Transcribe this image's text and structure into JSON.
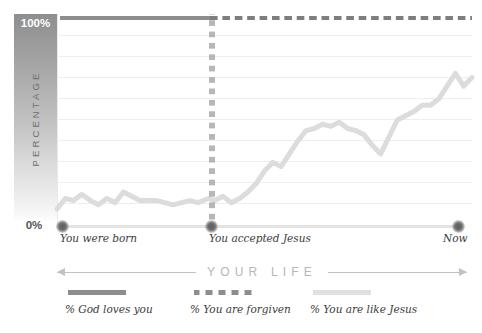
{
  "chart_data": {
    "type": "line",
    "title": "",
    "xlabel": "YOUR LIFE",
    "ylabel": "PERCENTAGE",
    "ylim": [
      0,
      100
    ],
    "y_ticks": [
      "0%",
      "100%"
    ],
    "grid": true,
    "gridline_count": 9,
    "x_markers": [
      {
        "label": "You were born",
        "x_pct": 0
      },
      {
        "label": "You accepted Jesus",
        "x_pct": 36.5
      },
      {
        "label": "Now",
        "x_pct": 100
      }
    ],
    "legend_position": "bottom",
    "series": [
      {
        "name": "% God loves you",
        "style": "solid",
        "color": "#8d8d8d",
        "constant_value": 100,
        "x": [
          0,
          36.5
        ],
        "values": [
          100,
          100
        ]
      },
      {
        "name": "% You are forgiven",
        "style": "dashed",
        "color": "#7e7e7e",
        "constant_value": 100,
        "x": [
          36.5,
          100
        ],
        "values": [
          100,
          100
        ]
      },
      {
        "name": "% You are like Jesus",
        "style": "solid",
        "color": "#dcdcdc",
        "x": [
          0,
          2,
          4,
          6,
          8,
          10,
          12,
          14,
          16,
          18,
          20,
          22,
          24,
          26,
          28,
          30,
          32,
          34,
          36.5,
          38,
          40,
          42,
          44,
          46,
          48,
          50,
          52,
          54,
          56,
          58,
          60,
          62,
          64,
          66,
          68,
          70,
          72,
          74,
          76,
          78,
          80,
          82,
          84,
          86,
          88,
          90,
          92,
          94,
          96,
          98,
          100
        ],
        "values": [
          8,
          13,
          12,
          15,
          12,
          10,
          13,
          11,
          16,
          14,
          12,
          12,
          12,
          11,
          10,
          11,
          12,
          11,
          13,
          12,
          14,
          11,
          13,
          16,
          20,
          26,
          30,
          28,
          34,
          40,
          45,
          46,
          48,
          47,
          49,
          46,
          45,
          43,
          38,
          34,
          42,
          50,
          52,
          54,
          57,
          57,
          60,
          66,
          72,
          66,
          70
        ]
      }
    ]
  },
  "axis": {
    "y_top_label": "100%",
    "y_bottom_label": "0%",
    "y_axis_title": "PERCENTAGE",
    "x_axis_title": "YOUR LIFE",
    "x_labels": {
      "start": "You were born",
      "middle": "You accepted Jesus",
      "end": "Now"
    }
  },
  "legend": {
    "items": [
      {
        "label": "% God loves you",
        "swatch": "solid-dark"
      },
      {
        "label": "% You are forgiven",
        "swatch": "dotted"
      },
      {
        "label": "% You are like Jesus",
        "swatch": "solid-light"
      }
    ]
  },
  "colors": {
    "series_loved": "#8d8d8d",
    "series_forgiven": "#7e7e7e",
    "series_like_jesus": "#dcdcdc",
    "gridline": "#eceef0",
    "baseline": "#e3e3e3",
    "text": "#3c3c3c",
    "muted_text": "#b4b6b8"
  }
}
